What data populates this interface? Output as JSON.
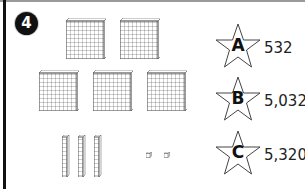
{
  "question": {
    "number": "4"
  },
  "blocks": {
    "hundreds": 5,
    "tens": 3,
    "ones": 2
  },
  "choices": [
    {
      "letter": "A",
      "value": "532"
    },
    {
      "letter": "B",
      "value": "5,032"
    },
    {
      "letter": "C",
      "value": "5,320"
    }
  ],
  "colors": {
    "grid_line": "#555555",
    "badge_bg": "#111111",
    "border_left": "#111111",
    "border_top": "#9a9a9a"
  }
}
